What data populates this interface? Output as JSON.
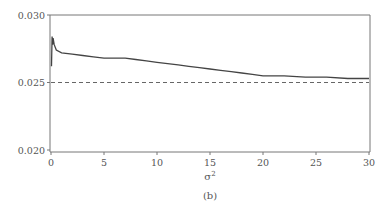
{
  "chart_data": {
    "type": "line",
    "title": "",
    "panel_label": "(b)",
    "xlabel": "σ²",
    "ylabel": "",
    "xlim": [
      0,
      30
    ],
    "ylim": [
      0.02,
      0.03
    ],
    "x_ticks": [
      "0",
      "5",
      "10",
      "15",
      "20",
      "25",
      "30"
    ],
    "y_ticks": [
      "0.020",
      "0.025",
      "0.030"
    ],
    "grid": false,
    "legend": null,
    "series": [
      {
        "name": "curve",
        "style": "solid",
        "color": "#444444",
        "x": [
          0.05,
          0.1,
          0.15,
          0.2,
          0.3,
          0.5,
          1,
          2,
          3,
          4,
          5,
          6,
          7,
          8,
          9,
          10,
          11,
          12,
          13,
          14,
          15,
          16,
          17,
          18,
          19,
          20,
          22,
          24,
          26,
          28,
          30
        ],
        "y": [
          0.0262,
          0.0284,
          0.0278,
          0.0283,
          0.0278,
          0.0274,
          0.0272,
          0.0271,
          0.027,
          0.0269,
          0.0268,
          0.0268,
          0.0268,
          0.0267,
          0.0266,
          0.0265,
          0.0264,
          0.0263,
          0.0262,
          0.0261,
          0.026,
          0.0259,
          0.0258,
          0.0257,
          0.0256,
          0.0255,
          0.0255,
          0.0254,
          0.0254,
          0.0253,
          0.0253
        ]
      },
      {
        "name": "reference",
        "style": "dashed",
        "color": "#666666",
        "x": [
          0,
          30
        ],
        "y": [
          0.025,
          0.025
        ]
      }
    ]
  }
}
